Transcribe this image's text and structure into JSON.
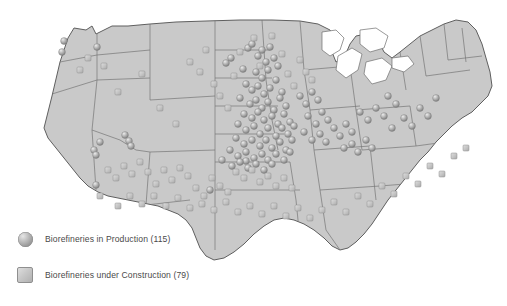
{
  "map": {
    "title": "Biorefineries in the United States",
    "region": "United States",
    "land_color": "#c9c9c9",
    "border_color": "#6e6e6e",
    "background_color": "#ffffff",
    "water_color": "#ffffff"
  },
  "legend": {
    "items": [
      {
        "marker": "sphere-marker-icon",
        "label": "Biorefineries in Production (115)",
        "category": "Biorefineries in Production",
        "count": 115,
        "color": "#9d9d9d"
      },
      {
        "marker": "square-marker-icon",
        "label": "Biorefineries under Construction (79)",
        "category": "Biorefineries under Construction",
        "count": 79,
        "color": "#c8c8c8"
      }
    ]
  },
  "chart_data": {
    "type": "scatter",
    "xlabel": "",
    "ylabel": "",
    "series": [
      {
        "name": "Biorefineries in Production (115)",
        "marker": "sphere",
        "count": 115,
        "points": [
          [
            64,
            41
          ],
          [
            62,
            52
          ],
          [
            97,
            47
          ],
          [
            100,
            142
          ],
          [
            94,
            150
          ],
          [
            96,
            155
          ],
          [
            125,
            135
          ],
          [
            129,
            141
          ],
          [
            131,
            146
          ],
          [
            96,
            185
          ],
          [
            210,
            190
          ],
          [
            246,
            161
          ],
          [
            226,
            63
          ],
          [
            231,
            58
          ],
          [
            243,
            69
          ],
          [
            248,
            48
          ],
          [
            252,
            44
          ],
          [
            258,
            56
          ],
          [
            262,
            50
          ],
          [
            266,
            62
          ],
          [
            270,
            47
          ],
          [
            256,
            72
          ],
          [
            262,
            78
          ],
          [
            268,
            70
          ],
          [
            274,
            58
          ],
          [
            278,
            66
          ],
          [
            246,
            84
          ],
          [
            252,
            90
          ],
          [
            258,
            86
          ],
          [
            264,
            94
          ],
          [
            270,
            88
          ],
          [
            276,
            80
          ],
          [
            282,
            92
          ],
          [
            240,
            98
          ],
          [
            250,
            104
          ],
          [
            256,
            100
          ],
          [
            262,
            108
          ],
          [
            268,
            102
          ],
          [
            274,
            110
          ],
          [
            280,
            98
          ],
          [
            286,
            106
          ],
          [
            244,
            114
          ],
          [
            252,
            118
          ],
          [
            258,
            112
          ],
          [
            264,
            120
          ],
          [
            272,
            116
          ],
          [
            278,
            124
          ],
          [
            284,
            114
          ],
          [
            290,
            122
          ],
          [
            238,
            124
          ],
          [
            246,
            130
          ],
          [
            254,
            126
          ],
          [
            260,
            134
          ],
          [
            268,
            128
          ],
          [
            276,
            136
          ],
          [
            282,
            128
          ],
          [
            288,
            134
          ],
          [
            294,
            126
          ],
          [
            236,
            138
          ],
          [
            244,
            144
          ],
          [
            252,
            140
          ],
          [
            260,
            146
          ],
          [
            266,
            140
          ],
          [
            272,
            148
          ],
          [
            280,
            142
          ],
          [
            286,
            150
          ],
          [
            292,
            140
          ],
          [
            230,
            150
          ],
          [
            238,
            156
          ],
          [
            246,
            152
          ],
          [
            254,
            158
          ],
          [
            262,
            154
          ],
          [
            268,
            160
          ],
          [
            276,
            154
          ],
          [
            284,
            160
          ],
          [
            290,
            152
          ],
          [
            222,
            160
          ],
          [
            232,
            166
          ],
          [
            240,
            162
          ],
          [
            248,
            168
          ],
          [
            256,
            164
          ],
          [
            264,
            170
          ],
          [
            272,
            164
          ],
          [
            300,
            96
          ],
          [
            306,
            104
          ],
          [
            312,
            92
          ],
          [
            318,
            100
          ],
          [
            308,
            116
          ],
          [
            316,
            124
          ],
          [
            322,
            112
          ],
          [
            328,
            120
          ],
          [
            304,
            132
          ],
          [
            312,
            140
          ],
          [
            320,
            134
          ],
          [
            326,
            142
          ],
          [
            334,
            128
          ],
          [
            340,
            136
          ],
          [
            346,
            124
          ],
          [
            352,
            132
          ],
          [
            344,
            148
          ],
          [
            352,
            144
          ],
          [
            358,
            152
          ],
          [
            366,
            140
          ],
          [
            372,
            148
          ],
          [
            360,
            112
          ],
          [
            368,
            120
          ],
          [
            376,
            108
          ],
          [
            384,
            116
          ],
          [
            392,
            128
          ],
          [
            388,
            96
          ],
          [
            396,
            104
          ],
          [
            404,
            118
          ],
          [
            412,
            126
          ],
          [
            420,
            108
          ],
          [
            428,
            116
          ],
          [
            436,
            98
          ]
        ]
      },
      {
        "name": "Biorefineries under Construction (79)",
        "marker": "square",
        "count": 79,
        "points": [
          [
            88,
            58
          ],
          [
            80,
            70
          ],
          [
            104,
            66
          ],
          [
            118,
            92
          ],
          [
            142,
            74
          ],
          [
            160,
            108
          ],
          [
            176,
            124
          ],
          [
            190,
            62
          ],
          [
            200,
            72
          ],
          [
            206,
            50
          ],
          [
            214,
            84
          ],
          [
            220,
            96
          ],
          [
            228,
            108
          ],
          [
            234,
            76
          ],
          [
            240,
            52
          ],
          [
            254,
            38
          ],
          [
            260,
            66
          ],
          [
            272,
            36
          ],
          [
            282,
            54
          ],
          [
            288,
            74
          ],
          [
            294,
            86
          ],
          [
            300,
            60
          ],
          [
            306,
            72
          ],
          [
            312,
            80
          ],
          [
            236,
            172
          ],
          [
            244,
            178
          ],
          [
            252,
            170
          ],
          [
            260,
            182
          ],
          [
            268,
            176
          ],
          [
            276,
            186
          ],
          [
            284,
            178
          ],
          [
            292,
            188
          ],
          [
            212,
            178
          ],
          [
            220,
            186
          ],
          [
            228,
            192
          ],
          [
            204,
            196
          ],
          [
            196,
            188
          ],
          [
            188,
            176
          ],
          [
            180,
            168
          ],
          [
            172,
            180
          ],
          [
            164,
            170
          ],
          [
            156,
            184
          ],
          [
            148,
            172
          ],
          [
            140,
            162
          ],
          [
            132,
            174
          ],
          [
            124,
            166
          ],
          [
            116,
            178
          ],
          [
            108,
            170
          ],
          [
            100,
            196
          ],
          [
            118,
            206
          ],
          [
            130,
            196
          ],
          [
            142,
            204
          ],
          [
            154,
            196
          ],
          [
            166,
            206
          ],
          [
            178,
            198
          ],
          [
            190,
            208
          ],
          [
            202,
            204
          ],
          [
            214,
            210
          ],
          [
            226,
            202
          ],
          [
            238,
            212
          ],
          [
            250,
            206
          ],
          [
            262,
            214
          ],
          [
            274,
            206
          ],
          [
            286,
            216
          ],
          [
            298,
            208
          ],
          [
            310,
            218
          ],
          [
            322,
            210
          ],
          [
            334,
            202
          ],
          [
            346,
            212
          ],
          [
            358,
            196
          ],
          [
            370,
            204
          ],
          [
            382,
            186
          ],
          [
            394,
            194
          ],
          [
            406,
            176
          ],
          [
            418,
            184
          ],
          [
            430,
            166
          ],
          [
            442,
            174
          ],
          [
            454,
            156
          ],
          [
            466,
            148
          ]
        ]
      }
    ]
  }
}
